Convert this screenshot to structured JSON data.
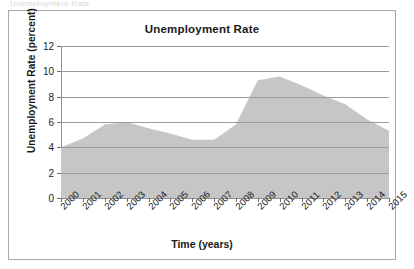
{
  "scan": {
    "top_sliver_text": "Unemployment Rate"
  },
  "chart_data": {
    "type": "area",
    "title": "Unemployment Rate",
    "xlabel": "Time (years)",
    "ylabel": "Unemployment Rate (percent)",
    "categories": [
      "2000",
      "2001",
      "2002",
      "2003",
      "2004",
      "2005",
      "2006",
      "2007",
      "2008",
      "2009",
      "2010",
      "2011",
      "2012",
      "2013",
      "2014",
      "2015"
    ],
    "values": [
      4.0,
      4.7,
      5.8,
      6.0,
      5.5,
      5.1,
      4.6,
      4.6,
      5.8,
      9.3,
      9.6,
      8.9,
      8.1,
      7.4,
      6.2,
      5.3
    ],
    "ylim": [
      0,
      12
    ],
    "yticks": [
      0,
      2,
      4,
      6,
      8,
      10,
      12
    ],
    "ytick_labels": [
      "0",
      "2",
      "4",
      "6",
      "8",
      "10",
      "12"
    ],
    "grid": true,
    "legend": "none",
    "series_color": "#c6c6c6",
    "grid_color": "#9c9c9c",
    "axis_color": "#8f8f8f",
    "text_color": "#1a1a1a",
    "frame_color": "#a9a9a9"
  }
}
